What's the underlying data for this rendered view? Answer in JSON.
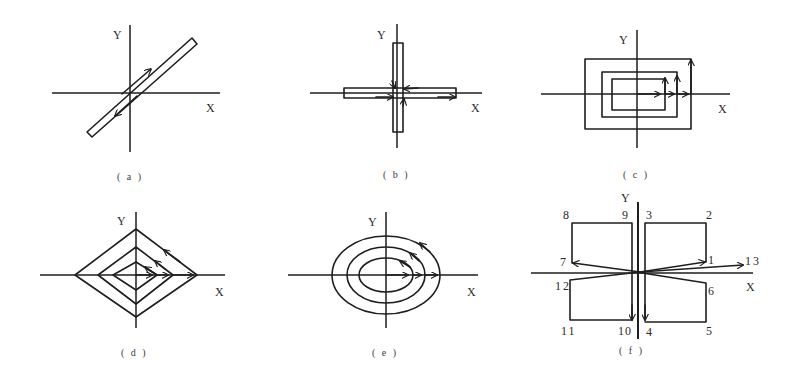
{
  "figure": {
    "ink_color": "#1e1e1e",
    "background": "#ffffff",
    "panels": [
      {
        "id": "a",
        "caption": "( a )",
        "axis_labels": {
          "x": "X",
          "y": "Y"
        },
        "shape": "diagonal-bar",
        "description": "Narrow diagonal bar through origin with arrow up-right on one side and down-left on the other"
      },
      {
        "id": "b",
        "caption": "( b )",
        "axis_labels": {
          "x": "X",
          "y": "Y"
        },
        "shape": "cross-bars",
        "description": "Narrow horizontal and vertical bars forming a cross with arrows converging at origin"
      },
      {
        "id": "c",
        "caption": "( c )",
        "axis_labels": {
          "x": "X",
          "y": "Y"
        },
        "shape": "nested-rectangles",
        "description": "Three nested rectangles (square spiral) with arrows pointing right along X and up along right edges"
      },
      {
        "id": "d",
        "caption": "( d )",
        "axis_labels": {
          "x": "X",
          "y": "Y"
        },
        "shape": "nested-diamonds",
        "description": "Three nested diamonds with arrows along X axis and up-left along upper-right edges"
      },
      {
        "id": "e",
        "caption": "( e )",
        "axis_labels": {
          "x": "X",
          "y": "Y"
        },
        "shape": "nested-ellipses",
        "description": "Three concentric ellipses with arrows along X axis and counter-clockwise along upper-right arcs"
      },
      {
        "id": "f",
        "caption": "( f )",
        "axis_labels": {
          "x": "X",
          "y": "Y"
        },
        "shape": "numbered-path",
        "description": "Path through numbered points 1-13 forming four quadrant rectangles",
        "point_labels": [
          "1",
          "2",
          "3",
          "4",
          "5",
          "6",
          "7",
          "8",
          "9",
          "10",
          "11",
          "12",
          "13"
        ]
      }
    ]
  }
}
